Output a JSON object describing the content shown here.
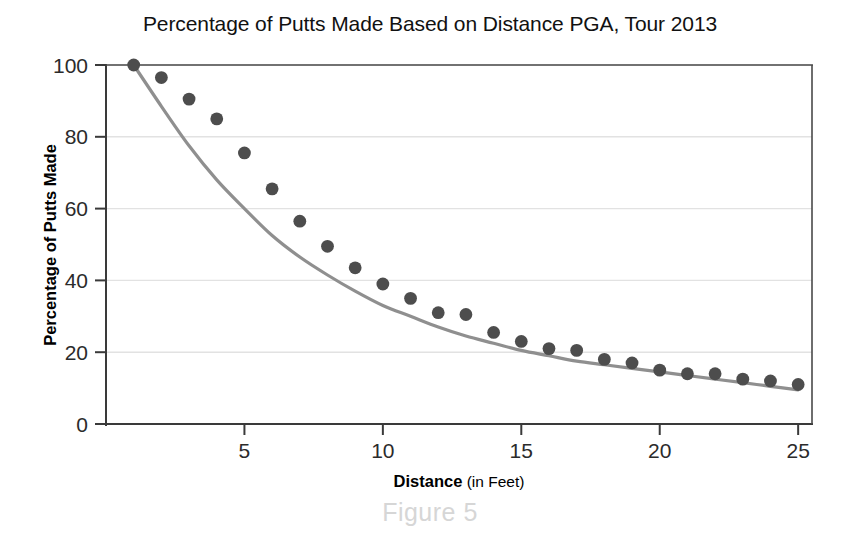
{
  "chart_data": {
    "type": "scatter",
    "title": "Percentage of Putts Made Based on Distance PGA, Tour 2013",
    "xlabel_bold": "Distance",
    "xlabel_rest": " (in Feet)",
    "ylabel": "Percentage of Putts Made",
    "xlim": [
      0,
      25.5
    ],
    "ylim": [
      0,
      105
    ],
    "xticks": [
      5,
      10,
      15,
      20,
      25
    ],
    "yticks": [
      0,
      20,
      40,
      60,
      80,
      100
    ],
    "xtick_labels": [
      "5",
      "10",
      "15",
      "20",
      "25"
    ],
    "ytick_labels": [
      "0",
      "20",
      "40",
      "60",
      "80",
      "100"
    ],
    "grid": "horizontal",
    "legend": "none",
    "x": [
      1,
      2,
      3,
      4,
      5,
      6,
      7,
      8,
      9,
      10,
      11,
      12,
      13,
      14,
      15,
      16,
      17,
      18,
      19,
      20,
      21,
      22,
      23,
      24,
      25
    ],
    "values": [
      100,
      96.5,
      90.5,
      85,
      75.5,
      65.5,
      56.5,
      49.5,
      43.5,
      39,
      35,
      31,
      30.5,
      25.5,
      23,
      21,
      20.5,
      18,
      17,
      15,
      14,
      14,
      12.5,
      12,
      11
    ],
    "series": [
      {
        "name": "Putts made",
        "marker": "filled-circle",
        "color": "#4d4d4d",
        "values": [
          100,
          96.5,
          90.5,
          85,
          75.5,
          65.5,
          56.5,
          49.5,
          43.5,
          39,
          35,
          31,
          30.5,
          25.5,
          23,
          21,
          20.5,
          18,
          17,
          15,
          14,
          14,
          12.5,
          12,
          11
        ]
      },
      {
        "name": "Fitted trend curve",
        "marker": "line",
        "color": "#8f8f8f",
        "x": [
          1,
          2,
          3,
          4,
          5,
          6,
          7,
          8,
          9,
          10,
          11,
          12,
          13,
          14,
          15,
          16,
          17,
          18,
          19,
          20,
          21,
          22,
          23,
          24,
          25
        ],
        "values": [
          100,
          88.5,
          77.5,
          68,
          60,
          52.5,
          46.5,
          41.5,
          37,
          33,
          30,
          27,
          24.5,
          22.5,
          20.5,
          19,
          17.5,
          16.5,
          15.5,
          14.5,
          13.5,
          12.5,
          11.5,
          10.5,
          9.5
        ]
      }
    ],
    "caption": "Figure 5",
    "colors": {
      "point": "#4d4d4d",
      "curve": "#8f8f8f",
      "axis": "#3a3a3a",
      "grid": "#e2e2e2",
      "caption": "#d6d6d6"
    }
  }
}
